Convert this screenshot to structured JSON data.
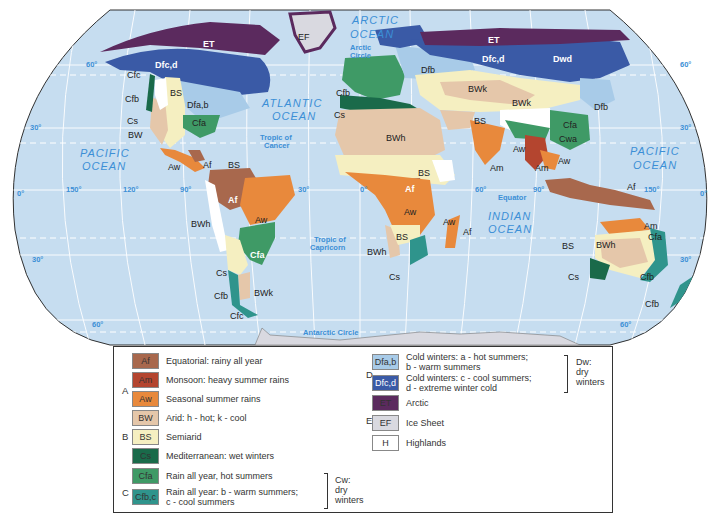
{
  "colors": {
    "ocean": "#c6ddf0",
    "grid": "#ffffff",
    "Af": "#a8684d",
    "Am": "#b4452f",
    "Aw": "#e8893c",
    "BW": "#e5c7aa",
    "BS": "#f5efc1",
    "Cs": "#1a6a4a",
    "Cfa": "#3f9a66",
    "Cfbc": "#2f948c",
    "Dfab": "#a8cbe8",
    "Dfcd": "#3a5aa6",
    "ET": "#5b2a5e",
    "EF": "#d9d9e0",
    "H": "#ffffff"
  },
  "oceans": {
    "arctic_1": "ARCTIC",
    "arctic_2": "OCEAN",
    "atlantic_1": "ATLANTIC",
    "atlantic_2": "OCEAN",
    "pacific_w_1": "PACIFIC",
    "pacific_w_2": "OCEAN",
    "pacific_e_1": "PACIFIC",
    "pacific_e_2": "OCEAN",
    "indian_1": "INDIAN",
    "indian_2": "OCEAN"
  },
  "geo_lines": {
    "arctic_circle_1": "Arctic",
    "arctic_circle_2": "Circle",
    "tropic_cancer_1": "Tropic of",
    "tropic_cancer_2": "Cancer",
    "equator": "Equator",
    "tropic_capricorn_1": "Tropic of",
    "tropic_capricorn_2": "Capricorn",
    "antarctic_circle": "Antarctic Circle"
  },
  "degrees": {
    "lat60n_w": "60°",
    "lat60n_e": "60°",
    "lat30n_w": "30°",
    "lat30n_e": "30°",
    "lat0_w": "0°",
    "lat0_e": "0°",
    "lat30s_w": "30°",
    "lat30s_e": "30°",
    "lat60s_w": "60°",
    "lat60s_e": "60°",
    "lon150w": "150°",
    "lon120w": "120°",
    "lon90w": "90°",
    "lon30w": "30°",
    "lon0": "0°",
    "lon60e": "60°",
    "lon90e": "90°",
    "lon150e": "150°"
  },
  "region_labels": {
    "na_et": "ET",
    "greenland_ef": "EF",
    "na_dfcd": "Dfc,d",
    "na_cfc": "Cfc",
    "na_cfb": "Cfb",
    "na_bs": "BS",
    "na_dfab": "Dfa,b",
    "na_cs": "Cs",
    "na_cfa": "Cfa",
    "na_bw": "BW",
    "ca_aw": "Aw",
    "ca_af": "Af",
    "ca_bs": "BS",
    "sa_af": "Af",
    "sa_aw": "Aw",
    "sa_bwh": "BWh",
    "sa_cfa": "Cfa",
    "sa_cs": "Cs",
    "sa_cfb": "Cfb",
    "sa_bwk": "BWk",
    "sa_cfc": "Cfc",
    "eu_cfb": "Cfb",
    "eu_cs": "Cs",
    "eu_dfb": "Dfb",
    "as_et": "ET",
    "as_dfcd": "Dfc,d",
    "as_dwd": "Dwd",
    "as_bwk1": "BWk",
    "as_bwk2": "BWk",
    "as_dfb": "Dfb",
    "as_bs": "BS",
    "as_cfa": "Cfa",
    "as_cwa": "Cwa",
    "as_aw1": "Aw",
    "as_am1": "Am",
    "as_am2": "Am",
    "as_aw2": "Aw",
    "af_bwh": "BWh",
    "af_bs1": "BS",
    "af_af": "Af",
    "af_aw": "Aw",
    "af_bs2": "BS",
    "af_bwh2": "BWh",
    "af_cs": "Cs",
    "mg_aw": "Aw",
    "mg_af": "Af",
    "oc_af": "Af",
    "au_am": "Am",
    "au_cfa": "Cfa",
    "au_bs": "BS",
    "au_bwh": "BWh",
    "au_cs": "Cs",
    "au_cfb": "Cfb",
    "nz_cfb": "Cfb"
  },
  "legend": {
    "groups": {
      "A": "A",
      "B": "B",
      "C": "C",
      "D": "D",
      "E": "E"
    },
    "items": [
      {
        "code": "Af",
        "text": "Equatorial: rainy all year"
      },
      {
        "code": "Am",
        "text": "Monsoon: heavy summer rains"
      },
      {
        "code": "Aw",
        "text": "Seasonal summer rains"
      },
      {
        "code": "BW",
        "text": "Arid: h - hot; k - cool"
      },
      {
        "code": "BS",
        "text": "Semiarid"
      },
      {
        "code": "Cs",
        "text": "Mediterranean: wet winters"
      },
      {
        "code": "Cfa",
        "text": "Rain all year, hot summers"
      },
      {
        "code": "Cfb,c",
        "text_1": "Rain all year: b - warm summers;",
        "text_2": "c - cool summers"
      },
      {
        "code": "Dfa,b",
        "text_1": "Cold winters: a - hot summers;",
        "text_2": "b - warm summers"
      },
      {
        "code": "Dfc,d",
        "text_1": "Cold winters: c - cool summers;",
        "text_2": "d - extreme winter cold"
      },
      {
        "code": "ET",
        "text": "Arctic"
      },
      {
        "code": "EF",
        "text": "Ice Sheet"
      },
      {
        "code": "H",
        "text": "Highlands"
      }
    ],
    "cw_note": {
      "l1": "Cw:",
      "l2": "dry",
      "l3": "winters"
    },
    "dw_note": {
      "l1": "Dw:",
      "l2": "dry",
      "l3": "winters"
    }
  }
}
